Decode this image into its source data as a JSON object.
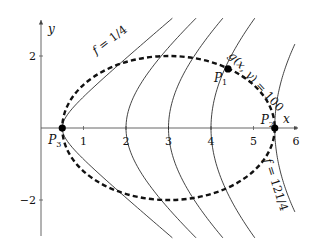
{
  "diagram": {
    "axes": {
      "x_label": "x",
      "y_label": "y",
      "x_ticks": [
        {
          "value": 1,
          "label": "1"
        },
        {
          "value": 2,
          "label": "2"
        },
        {
          "value": 3,
          "label": "3"
        },
        {
          "value": 4,
          "label": "4"
        },
        {
          "value": 5,
          "label": "5"
        },
        {
          "value": 6,
          "label": "6"
        }
      ],
      "y_ticks": [
        {
          "value": 2,
          "label": "2"
        },
        {
          "value": -2,
          "label": "−2"
        }
      ],
      "x_range": [
        0,
        6.05
      ],
      "y_range": [
        -3.0,
        3.0
      ]
    },
    "level_curves": {
      "function": "f = x^2 - y^2",
      "levels": [
        0.25,
        4,
        9,
        16,
        30.25
      ],
      "labels": {
        "first": "f = 1/4",
        "last": "f = 121/4"
      }
    },
    "constraint": {
      "label": "g(x, y) = 100",
      "center": [
        3,
        0
      ],
      "semi_axis_x": 2.5,
      "semi_axis_y": 2,
      "style": "dashed"
    },
    "points": [
      {
        "name": "P1",
        "label": "P",
        "sub": "1",
        "x": 4.4,
        "y": 1.64
      },
      {
        "name": "P2",
        "label": "P",
        "sub": "2",
        "x": 5.5,
        "y": 0
      },
      {
        "name": "P3",
        "label": "P",
        "sub": "3",
        "x": 0.5,
        "y": 0
      }
    ],
    "colors": {
      "ink": "#111111",
      "axis": "#555555",
      "background": "#ffffff"
    }
  }
}
